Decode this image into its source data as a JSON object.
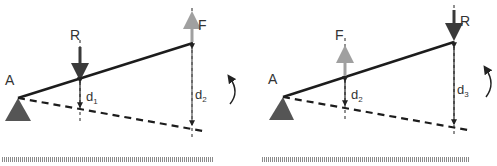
{
  "colors": {
    "beam": "#1c1c1c",
    "dashed": "#1c1c1c",
    "support": "#555555",
    "force_dark": "#3a3a3a",
    "force_light": "#a0a0a0",
    "dim": "#222222",
    "ground": "#9a9a9a",
    "label": "#333333"
  },
  "panels": [
    {
      "id": "left",
      "pivot_label": "A",
      "forces": [
        {
          "label": "R",
          "direction": "down",
          "shade": "dark"
        },
        {
          "label": "F",
          "direction": "up",
          "shade": "light"
        }
      ],
      "distances": [
        {
          "label": "d",
          "subscript": "1"
        },
        {
          "label": "d",
          "subscript": "2"
        }
      ],
      "rotation_icon": "counterclockwise-arc-arrow"
    },
    {
      "id": "right",
      "pivot_label": "A",
      "forces": [
        {
          "label": "F",
          "direction": "up",
          "shade": "light"
        },
        {
          "label": "R",
          "direction": "down",
          "shade": "dark"
        }
      ],
      "distances": [
        {
          "label": "d",
          "subscript": "2"
        },
        {
          "label": "d",
          "subscript": "3"
        }
      ],
      "rotation_icon": "counterclockwise-arc-arrow"
    }
  ]
}
